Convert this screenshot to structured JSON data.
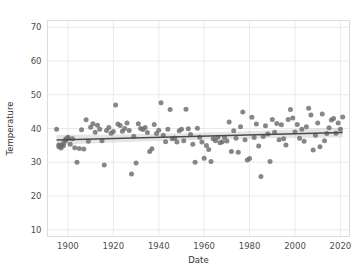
{
  "chart_data": {
    "type": "scatter",
    "title": "",
    "xlabel": "Date",
    "ylabel": "Temperature",
    "xlim": [
      1891,
      2024
    ],
    "ylim": [
      8,
      72
    ],
    "xticks": [
      1900,
      1920,
      1940,
      1960,
      1980,
      2000,
      2020
    ],
    "yticks": [
      10,
      20,
      30,
      40,
      50,
      60,
      70
    ],
    "grid": true,
    "legend": null,
    "marker_color": "#6d6d6d",
    "line_color": "#4a4a4a",
    "band_color": "#9a9a9a",
    "background_color": "#ffffff",
    "grid_color": "#e8e8ec",
    "regression": {
      "type": "linear-fit-with-confidence-band",
      "x_start": 1895,
      "x_end": 2021,
      "y_start": 36.6,
      "y_end": 38.8,
      "band_halfwidth_start": 1.5,
      "band_halfwidth_mid": 0.6,
      "band_halfwidth_end": 1.5
    },
    "x": [
      1895,
      1896,
      1896,
      1897,
      1897,
      1898,
      1898,
      1899,
      1899,
      1900,
      1900,
      1901,
      1902,
      1903,
      1904,
      1905,
      1906,
      1907,
      1908,
      1909,
      1910,
      1911,
      1912,
      1913,
      1914,
      1915,
      1916,
      1917,
      1918,
      1919,
      1920,
      1921,
      1922,
      1923,
      1924,
      1925,
      1926,
      1927,
      1928,
      1929,
      1930,
      1931,
      1932,
      1933,
      1934,
      1935,
      1936,
      1937,
      1938,
      1939,
      1940,
      1941,
      1942,
      1943,
      1944,
      1945,
      1946,
      1947,
      1948,
      1949,
      1950,
      1951,
      1952,
      1953,
      1954,
      1955,
      1956,
      1957,
      1958,
      1959,
      1960,
      1961,
      1962,
      1963,
      1964,
      1965,
      1966,
      1967,
      1968,
      1969,
      1970,
      1971,
      1972,
      1973,
      1974,
      1975,
      1976,
      1977,
      1978,
      1979,
      1980,
      1981,
      1982,
      1983,
      1984,
      1985,
      1986,
      1987,
      1988,
      1989,
      1990,
      1991,
      1992,
      1993,
      1994,
      1995,
      1996,
      1997,
      1998,
      1999,
      2000,
      2001,
      2002,
      2003,
      2004,
      2005,
      2006,
      2007,
      2008,
      2009,
      2010,
      2011,
      2012,
      2013,
      2014,
      2015,
      2016,
      2017,
      2018,
      2019,
      2020,
      2021
    ],
    "y": [
      39.8,
      34.6,
      35.1,
      34.2,
      35.0,
      34.9,
      35.6,
      36.4,
      36.9,
      37.1,
      37.4,
      35.3,
      37.0,
      34.3,
      30.0,
      34.1,
      39.6,
      33.9,
      42.6,
      36.2,
      40.4,
      41.4,
      38.9,
      41.0,
      39.8,
      36.4,
      29.2,
      39.4,
      40.3,
      38.6,
      39.1,
      47.0,
      41.3,
      40.9,
      39.2,
      40.0,
      41.6,
      39.4,
      26.5,
      37.7,
      29.8,
      41.4,
      40.0,
      39.7,
      40.3,
      38.8,
      33.2,
      34.0,
      41.2,
      38.5,
      39.5,
      47.6,
      38.0,
      36.1,
      39.8,
      45.6,
      37.0,
      37.2,
      36.0,
      39.3,
      39.8,
      36.4,
      45.7,
      39.9,
      38.2,
      35.3,
      30.0,
      40.1,
      37.4,
      36.0,
      31.2,
      35.0,
      33.8,
      30.2,
      37.0,
      36.4,
      37.4,
      35.8,
      36.1,
      37.4,
      36.3,
      41.9,
      33.2,
      39.3,
      37.1,
      33.0,
      40.5,
      44.9,
      36.7,
      30.7,
      31.1,
      43.3,
      37.3,
      41.3,
      34.8,
      25.8,
      37.6,
      40.8,
      38.4,
      30.2,
      42.7,
      38.9,
      41.5,
      36.7,
      41.1,
      37.0,
      35.1,
      42.7,
      45.6,
      43.1,
      39.0,
      41.2,
      37.1,
      39.8,
      36.2,
      40.5,
      46.0,
      44.0,
      33.6,
      38.0,
      41.6,
      34.6,
      44.3,
      36.4,
      38.5,
      40.2,
      42.5,
      43.0,
      38.6,
      41.6,
      39.8,
      43.4
    ]
  }
}
